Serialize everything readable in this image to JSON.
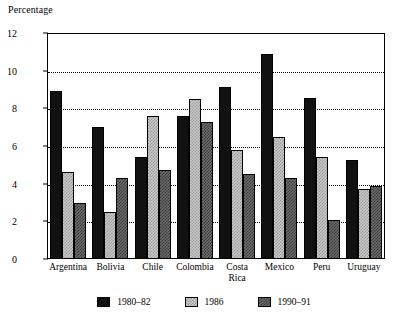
{
  "chart_data": {
    "type": "bar",
    "title": "Percentage",
    "xlabel": "",
    "ylabel": "Percentage",
    "ylim": [
      0,
      12
    ],
    "yticks": [
      0,
      2,
      4,
      6,
      8,
      10,
      12
    ],
    "grid": "horizontal-dotted",
    "legend_position": "bottom",
    "categories": [
      "Argentina",
      "Bolivia",
      "Chile",
      "Colombia",
      "Costa\nRica",
      "Mexico",
      "Peru",
      "Uruguay"
    ],
    "series": [
      {
        "name": "1980–82",
        "color": "#111111",
        "values": [
          8.9,
          7.0,
          5.4,
          7.6,
          9.15,
          10.9,
          8.55,
          5.25
        ]
      },
      {
        "name": "1986",
        "color": "#c9c9c9",
        "values": [
          4.6,
          2.5,
          7.6,
          8.5,
          5.8,
          6.5,
          5.4,
          3.7
        ]
      },
      {
        "name": "1990–91",
        "color": "#6b6b6b",
        "values": [
          3.0,
          4.3,
          4.7,
          7.25,
          4.5,
          4.3,
          2.05,
          3.9
        ]
      }
    ]
  }
}
